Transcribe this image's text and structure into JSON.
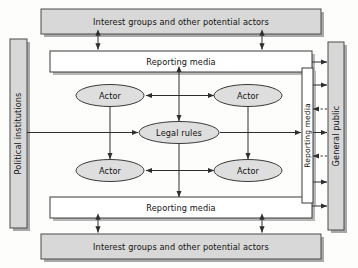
{
  "diagram": {
    "colors": {
      "shaded_fill": "#d8d8d8",
      "ellipse_fill": "#dedede",
      "white_fill": "#ffffff",
      "stroke": "#3a3a3a",
      "shadow": "#9a9a9a",
      "text": "#111111",
      "background": "#fdfdfb"
    },
    "boxes": {
      "interest_groups_top": {
        "label": "Interest groups and other potential actors",
        "style": "shaded"
      },
      "interest_groups_bottom": {
        "label": "Interest groups and other potential actors",
        "style": "shaded"
      },
      "political_institutions": {
        "label": "Political institutions",
        "style": "shaded",
        "orientation": "vertical"
      },
      "general_public": {
        "label": "General public",
        "style": "shaded",
        "orientation": "vertical"
      },
      "reporting_media_top": {
        "label": "Reporting media",
        "style": "white"
      },
      "reporting_media_bottom": {
        "label": "Reporting media",
        "style": "white"
      },
      "reporting_media_right": {
        "label": "Reporting media",
        "style": "white",
        "orientation": "vertical"
      }
    },
    "ellipses": {
      "actor_top_left": {
        "label": "Actor"
      },
      "actor_top_right": {
        "label": "Actor"
      },
      "actor_bottom_left": {
        "label": "Actor"
      },
      "actor_bottom_right": {
        "label": "Actor"
      },
      "legal_rules": {
        "label": "Legal rules"
      }
    },
    "connections": [
      {
        "from": "interest_groups_top",
        "to": "reporting_media_top",
        "type": "double-arrow",
        "line": "solid"
      },
      {
        "from": "interest_groups_top",
        "to": "reporting_media_top",
        "type": "double-arrow",
        "line": "solid"
      },
      {
        "from": "interest_groups_bottom",
        "to": "reporting_media_bottom",
        "type": "double-arrow",
        "line": "solid"
      },
      {
        "from": "interest_groups_bottom",
        "to": "reporting_media_bottom",
        "type": "double-arrow",
        "line": "solid"
      },
      {
        "from": "political_institutions",
        "to": "legal_rules",
        "type": "arrow",
        "line": "solid"
      },
      {
        "from": "actor_top_left",
        "to": "actor_top_right",
        "type": "double-arrow",
        "line": "solid"
      },
      {
        "from": "actor_bottom_left",
        "to": "actor_bottom_right",
        "type": "double-arrow",
        "line": "solid"
      },
      {
        "from": "actor_top_left",
        "to": "actor_bottom_left",
        "type": "double-arrow",
        "line": "solid"
      },
      {
        "from": "actor_top_right",
        "to": "actor_bottom_right",
        "type": "double-arrow",
        "line": "solid"
      },
      {
        "from": "legal_rules",
        "to": "reporting_media_top",
        "type": "double-arrow",
        "line": "solid"
      },
      {
        "from": "legal_rules",
        "to": "reporting_media_bottom",
        "type": "double-arrow",
        "line": "solid"
      },
      {
        "from": "legal_rules",
        "to": "reporting_media_right",
        "type": "arrow",
        "line": "solid"
      },
      {
        "from": "reporting_media_right",
        "to": "general_public",
        "type": "arrow",
        "line": "solid"
      },
      {
        "from": "general_public",
        "to": "reporting_media_right",
        "type": "arrow",
        "line": "dashed"
      },
      {
        "from": "reporting_media_top",
        "to": "general_public",
        "type": "arrow",
        "line": "solid"
      },
      {
        "from": "reporting_media_bottom",
        "to": "general_public",
        "type": "arrow",
        "line": "solid"
      }
    ]
  }
}
